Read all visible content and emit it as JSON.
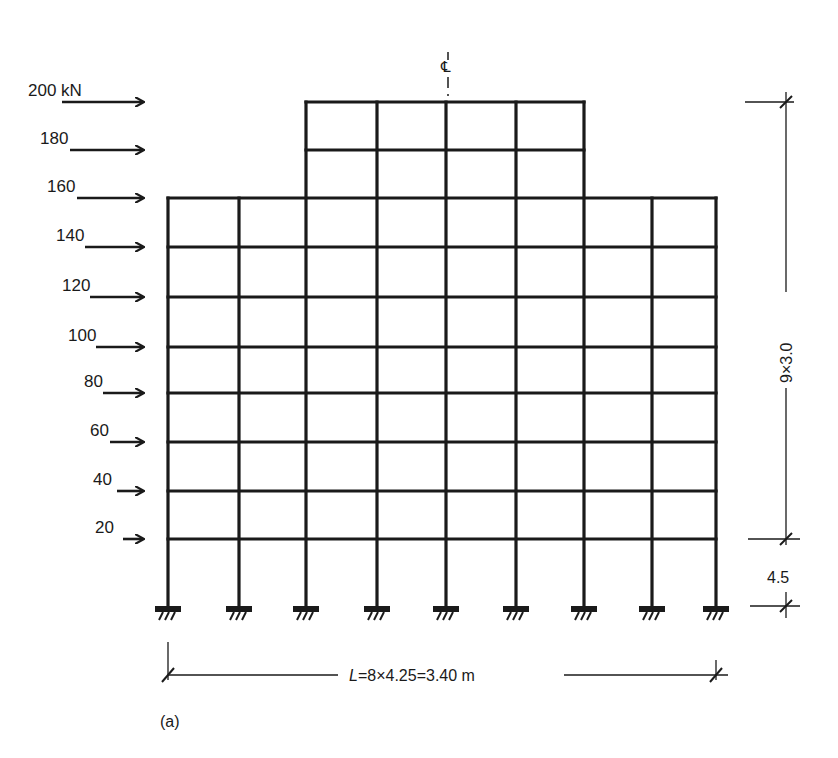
{
  "diagram": {
    "caption": "(a)",
    "centerline_label": "℄",
    "load_unit_label": "200 kN",
    "loads": [
      {
        "label": "200 kN",
        "value": 200,
        "y": 102,
        "label_x": 28,
        "arrow_x1": 62
      },
      {
        "label": "180",
        "value": 180,
        "y": 150,
        "label_x": 40,
        "arrow_x1": 70
      },
      {
        "label": "160",
        "value": 160,
        "y": 198,
        "label_x": 47,
        "arrow_x1": 77
      },
      {
        "label": "140",
        "value": 140,
        "y": 247,
        "label_x": 56,
        "arrow_x1": 85
      },
      {
        "label": "120",
        "value": 120,
        "y": 297,
        "label_x": 62,
        "arrow_x1": 90
      },
      {
        "label": "100",
        "value": 100,
        "y": 347,
        "label_x": 68,
        "arrow_x1": 96
      },
      {
        "label": "80",
        "value": 80,
        "y": 393,
        "label_x": 84,
        "arrow_x1": 103
      },
      {
        "label": "60",
        "value": 60,
        "y": 442,
        "label_x": 90,
        "arrow_x1": 110
      },
      {
        "label": "40",
        "value": 40,
        "y": 491,
        "label_x": 93,
        "arrow_x1": 117
      },
      {
        "label": "20",
        "value": 20,
        "y": 539,
        "label_x": 95,
        "arrow_x1": 123
      }
    ],
    "frame": {
      "columns_x": [
        168,
        239,
        306,
        377,
        446,
        516,
        584,
        652,
        716
      ],
      "floors_y": [
        539,
        491,
        442,
        393,
        347,
        297,
        247,
        198,
        150,
        102
      ],
      "base_y": 606,
      "main_floor_count": 8,
      "tower": {
        "x_left": 306,
        "x_right": 584,
        "top_y": 102,
        "levels_y": [
          150,
          102
        ]
      },
      "bays": 8,
      "stories_above_ground": 9
    },
    "dimensions": {
      "upper_height_label": "9×3.0",
      "ground_story_label": "4.5",
      "span_label_prefix": "L",
      "span_label": "=8×4.25=3.40 m"
    },
    "colors": {
      "ink": "#1a1a1a",
      "background": "#ffffff"
    }
  }
}
